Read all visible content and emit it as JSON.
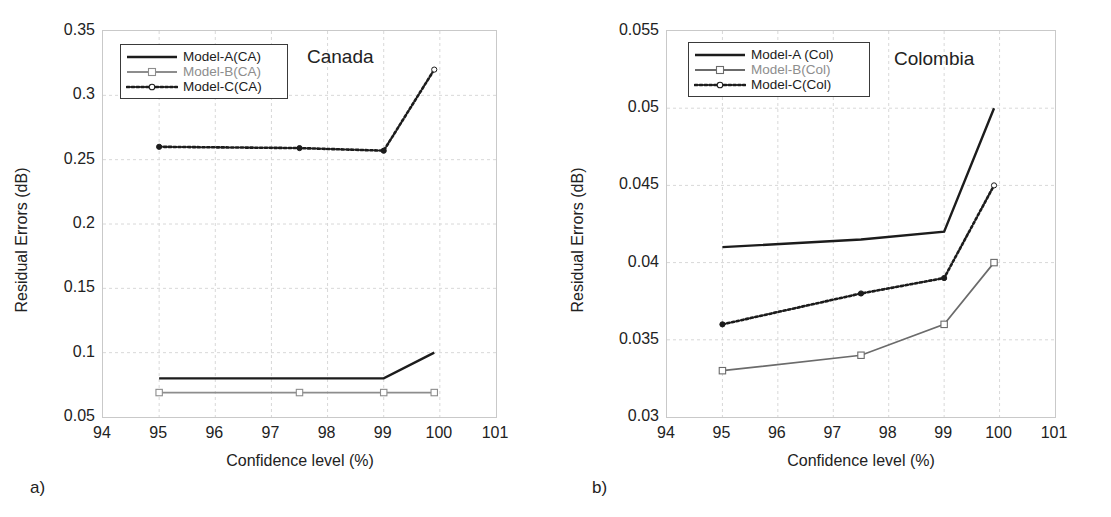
{
  "figure": {
    "subplot_labels": [
      "a)",
      "b)"
    ],
    "axis": {
      "xlabel": "Confidence level (%)",
      "ylabel": "Residual Errors (dB)"
    }
  },
  "chart_data": [
    {
      "type": "line",
      "title": "Canada",
      "panel_label": "a)",
      "xlabel": "Confidence level (%)",
      "ylabel": "Residual Errors (dB)",
      "xlim": [
        94,
        101
      ],
      "ylim": [
        0.05,
        0.35
      ],
      "xticks": [
        94,
        95,
        96,
        97,
        98,
        99,
        100,
        101
      ],
      "xtick_labels": [
        "94",
        "95",
        "96",
        "97",
        "98",
        "99",
        "100",
        "101"
      ],
      "yticks": [
        0.05,
        0.1,
        0.15,
        0.2,
        0.25,
        0.3,
        0.35
      ],
      "ytick_labels": [
        "0.05",
        "0.1",
        "0.15",
        "0.2",
        "0.25",
        "0.3",
        "0.35"
      ],
      "grid": true,
      "legend_position": "upper-left",
      "x": [
        95,
        97.5,
        99,
        99.9
      ],
      "series": [
        {
          "name": "Model-A(CA)",
          "values": [
            0.08,
            0.08,
            0.08,
            0.1
          ],
          "style": "solid",
          "color": "#1c1c1c",
          "marker": "none"
        },
        {
          "name": "Model-B(CA)",
          "values": [
            0.069,
            0.069,
            0.069,
            0.069
          ],
          "style": "solid",
          "color": "#8d8d8d",
          "marker": "square"
        },
        {
          "name": "Model-C(CA)",
          "values": [
            0.26,
            0.259,
            0.257,
            0.32
          ],
          "style": "dotted",
          "color": "#1c1c1c",
          "marker": "circle"
        }
      ]
    },
    {
      "type": "line",
      "title": "Colombia",
      "panel_label": "b)",
      "xlabel": "Confidence level (%)",
      "ylabel": "Residual Errors (dB)",
      "xlim": [
        94,
        101
      ],
      "ylim": [
        0.03,
        0.055
      ],
      "xticks": [
        94,
        95,
        96,
        97,
        98,
        99,
        100,
        101
      ],
      "xtick_labels": [
        "94",
        "95",
        "96",
        "97",
        "98",
        "99",
        "100",
        "101"
      ],
      "yticks": [
        0.03,
        0.035,
        0.04,
        0.045,
        0.05,
        0.055
      ],
      "ytick_labels": [
        "0.03",
        "0.035",
        "0.04",
        "0.045",
        "0.05",
        "0.055"
      ],
      "grid": true,
      "legend_position": "upper-left",
      "x": [
        95,
        97.5,
        99,
        99.9
      ],
      "series": [
        {
          "name": "Model-A (Col)",
          "values": [
            0.041,
            0.0415,
            0.042,
            0.05
          ],
          "style": "solid",
          "color": "#1c1c1c",
          "marker": "none"
        },
        {
          "name": "Model-B(Col)",
          "values": [
            0.033,
            0.034,
            0.036,
            0.04
          ],
          "style": "solid",
          "color": "#6b6b6b",
          "marker": "square"
        },
        {
          "name": "Model-C(Col)",
          "values": [
            0.036,
            0.038,
            0.039,
            0.045
          ],
          "style": "dotted",
          "color": "#1c1c1c",
          "marker": "circle"
        }
      ]
    }
  ],
  "colors": {
    "series_a": "#1c1c1c",
    "series_b": "#8d8d8d",
    "series_c": "#1c1c1c",
    "grid": "#d8d8d8",
    "frame": "#c9c9c9",
    "text": "#222222"
  }
}
